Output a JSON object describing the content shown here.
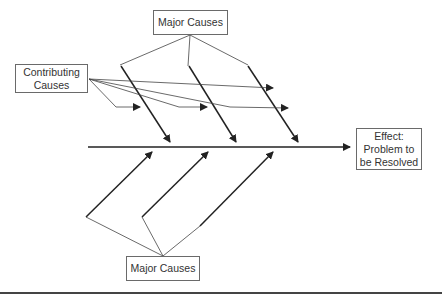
{
  "diagram": {
    "type": "fishbone (Ishikawa) cause-and-effect diagram",
    "boxes": {
      "top_major_causes": "Major Causes",
      "contributing_causes": [
        "Contributing",
        "Causes"
      ],
      "bottom_major_causes": "Major Causes",
      "effect": [
        "Effect:",
        "Problem to",
        "be Resolved"
      ]
    },
    "colors": {
      "line": "#222222",
      "thin_line": "#444444",
      "box_border": "#6a6a6a",
      "text": "#333333"
    }
  }
}
